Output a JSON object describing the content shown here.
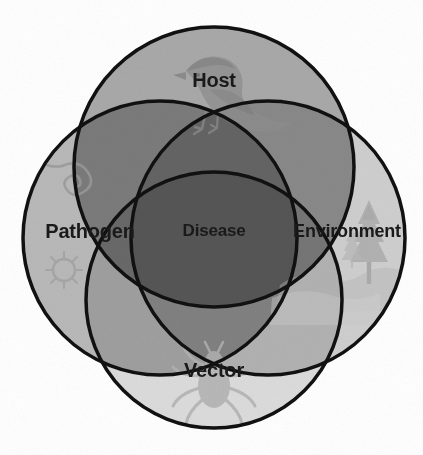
{
  "diagram": {
    "type": "venn",
    "center_label": "Disease",
    "sets": [
      {
        "id": "host",
        "label": "Host",
        "position": "top",
        "fill": "#a9a9a9",
        "icon": "bird-silhouette-icon",
        "cx": 214,
        "cy": 167,
        "r": 140
      },
      {
        "id": "pathogen",
        "label": "Pathogen",
        "position": "left",
        "fill": "#b9b9b9",
        "icon": "pathogen-microbe-icon",
        "cx": 160,
        "cy": 238,
        "r": 137
      },
      {
        "id": "environment",
        "label": "Environment",
        "position": "right",
        "fill": "#cfcfcf",
        "icon": "pine-tree-landscape-icon",
        "cx": 268,
        "cy": 238,
        "r": 137
      },
      {
        "id": "vector",
        "label": "Vector",
        "position": "bottom",
        "fill": "#dcdcdc",
        "icon": "tick-silhouette-icon",
        "cx": 214,
        "cy": 300,
        "r": 128
      }
    ],
    "stroke_color": "#111111",
    "stroke_width": 3.5,
    "background": "#ffffff",
    "label_color": "#1a1a1a"
  }
}
